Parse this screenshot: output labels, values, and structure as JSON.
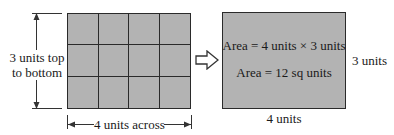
{
  "left_figure": {
    "grid": {
      "columns": 4,
      "rows": 3,
      "fill_color": "#b3b3b3",
      "line_color": "#2a2a2a"
    },
    "height_label_line1": "3 units top",
    "height_label_line2": "to bottom",
    "width_label": "4 units across"
  },
  "arrow": {
    "icon": "hollow-right-arrow-icon"
  },
  "right_figure": {
    "fill_color": "#b3b3b3",
    "formula_line1": "Area = 4 units × 3 units",
    "formula_line2": "Area = 12 sq units",
    "height_label": "3 units",
    "width_label": "4 units"
  }
}
